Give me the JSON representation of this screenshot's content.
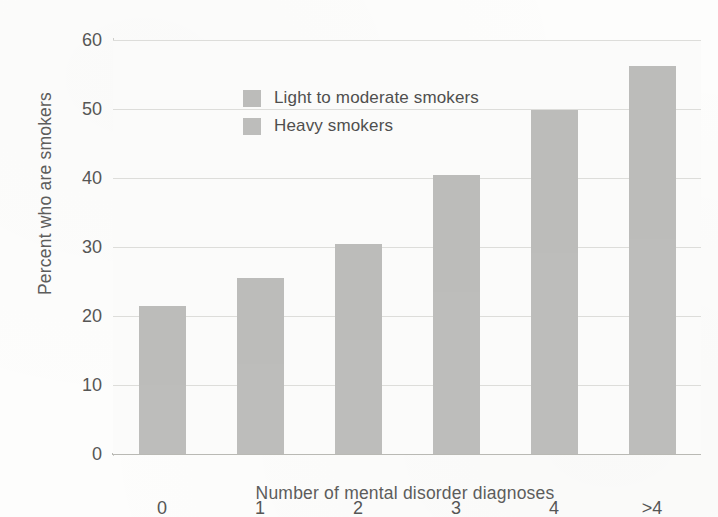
{
  "chart_data": {
    "type": "bar",
    "subtype": "stacked-vertical",
    "title": "",
    "xlabel": "Number of mental disorder diagnoses",
    "ylabel": "Percent who are smokers",
    "categories": [
      "0",
      "1",
      "2",
      "3",
      "4",
      ">4"
    ],
    "ylim": [
      0,
      60
    ],
    "yticks": [
      0,
      10,
      20,
      30,
      40,
      50,
      60
    ],
    "ytick_labels": [
      "0",
      "10",
      "20",
      "30",
      "40",
      "50",
      "60"
    ],
    "grid": "horizontal",
    "legend_position": "upper-left-inside",
    "series": [
      {
        "name": "Light to moderate smokers",
        "color": "#bcbcba",
        "values": [
          11.5,
          12.5,
          14.0,
          17.0,
          20.6,
          25.0
        ]
      },
      {
        "name": "Heavy smokers",
        "color": "#bdbdbb",
        "values": [
          10.0,
          13.0,
          16.5,
          23.5,
          29.2,
          31.2
        ]
      }
    ],
    "totals": [
      21.5,
      25.5,
      30.5,
      40.5,
      49.8,
      56.2
    ]
  },
  "legend": {
    "items": [
      {
        "label": "Light to moderate smokers",
        "swatch": "#bcbcba"
      },
      {
        "label": "Heavy smokers",
        "swatch": "#bdbdbb"
      }
    ]
  },
  "axes": {
    "y_title": "Percent who are smokers",
    "x_title": "Number of mental disorder diagnoses"
  }
}
